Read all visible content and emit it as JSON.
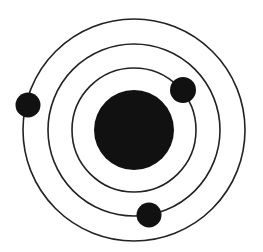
{
  "diagram": {
    "type": "atom-model",
    "width": 263,
    "height": 252,
    "background": "#ffffff",
    "stroke_color": "#222222",
    "fill_color": "#111111",
    "center": {
      "x": 134,
      "y": 130
    },
    "nucleus": {
      "r": 40
    },
    "orbits": [
      {
        "name": "inner-orbit",
        "r": 62
      },
      {
        "name": "middle-orbit",
        "r": 86
      },
      {
        "name": "outer-orbit",
        "r": 111
      }
    ],
    "electrons": [
      {
        "name": "electron-outer",
        "orbit": "outer-orbit",
        "x": 28,
        "y": 105,
        "r": 12.5
      },
      {
        "name": "electron-inner",
        "orbit": "inner-orbit",
        "x": 183,
        "y": 90,
        "r": 13
      },
      {
        "name": "electron-middle",
        "orbit": "middle-orbit",
        "x": 149,
        "y": 215,
        "r": 12.5
      }
    ]
  }
}
